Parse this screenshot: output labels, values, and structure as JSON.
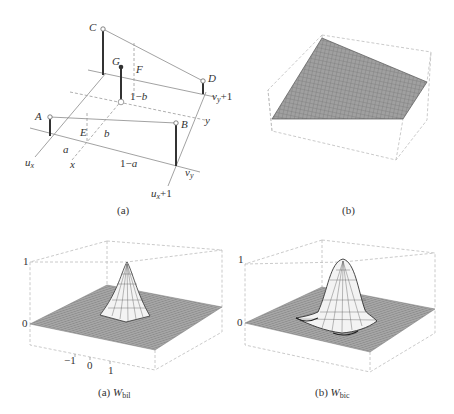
{
  "figure_a": {
    "caption": "(a)",
    "points": {
      "A": "A",
      "B": "B",
      "C": "C",
      "D": "D",
      "E": "E",
      "F": "F",
      "G": "G"
    },
    "labels": {
      "a": "a",
      "one_minus_a": "1−a",
      "b": "b",
      "one_minus_b": "1−b",
      "ux": "u",
      "ux_sub": "x",
      "ux1": "u",
      "ux1_sub": "x",
      "ux1_suffix": "+1",
      "vy": "v",
      "vy_sub": "y",
      "vy1": "v",
      "vy1_sub": "y",
      "vy1_suffix": "+1",
      "x": "x",
      "y": "y"
    }
  },
  "figure_b": {
    "caption": "(b)"
  },
  "figure_c": {
    "caption_prefix": "(a) ",
    "caption_W": "W",
    "caption_sub": "bil",
    "z_ticks": [
      "1",
      "0"
    ],
    "x_ticks": [
      "−1",
      "0",
      "1"
    ]
  },
  "figure_d": {
    "caption_prefix": "(b) ",
    "caption_W": "W",
    "caption_sub": "bic",
    "z_ticks": [
      "1",
      "0"
    ]
  }
}
